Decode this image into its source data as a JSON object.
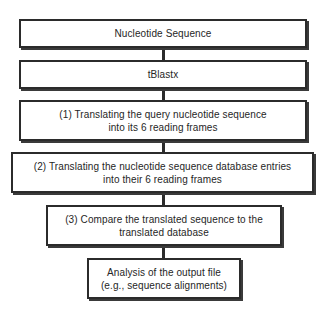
{
  "diagram": {
    "background_color": "#ffffff",
    "box_border_color": "#2b2b2b",
    "box_fill_color": "#ffffff",
    "text_color": "#262626",
    "connector_color": "#2b2b2b",
    "nodes": [
      {
        "id": "nucleotide-sequence",
        "lines": [
          "Nucleotide Sequence"
        ],
        "x": 19,
        "y": 19,
        "width": 288,
        "height": 29
      },
      {
        "id": "tblastx",
        "lines": [
          "tBlastx"
        ],
        "x": 19,
        "y": 60,
        "width": 288,
        "height": 29
      },
      {
        "id": "step-1-translate-query",
        "lines": [
          "(1) Translating the query nucleotide sequence",
          "into its 6 reading frames"
        ],
        "x": 19,
        "y": 100,
        "width": 288,
        "height": 41
      },
      {
        "id": "step-2-translate-database",
        "lines": [
          "(2) Translating the nucleotide sequence database entries",
          "into their 6 reading frames"
        ],
        "x": 11,
        "y": 152,
        "width": 303,
        "height": 41
      },
      {
        "id": "step-3-compare",
        "lines": [
          "(3) Compare the translated sequence to the",
          "translated database"
        ],
        "x": 46,
        "y": 205,
        "width": 236,
        "height": 41
      },
      {
        "id": "analysis-output",
        "lines": [
          "Analysis of the output file",
          "(e.g., sequence alignments)"
        ],
        "x": 87,
        "y": 258,
        "width": 154,
        "height": 41
      }
    ],
    "connectors": [
      {
        "id": "connector-1-2",
        "from": "nucleotide-sequence",
        "to": "tblastx",
        "y": 46,
        "height": 16
      },
      {
        "id": "connector-2-3",
        "from": "tblastx",
        "to": "step-1-translate-query",
        "y": 87,
        "height": 15
      },
      {
        "id": "connector-3-4",
        "from": "step-1-translate-query",
        "to": "step-2-translate-database",
        "y": 139,
        "height": 15
      },
      {
        "id": "connector-4-5",
        "from": "step-2-translate-database",
        "to": "step-3-compare",
        "y": 191,
        "height": 16
      },
      {
        "id": "connector-5-6",
        "from": "step-3-compare",
        "to": "analysis-output",
        "y": 244,
        "height": 16
      }
    ]
  }
}
